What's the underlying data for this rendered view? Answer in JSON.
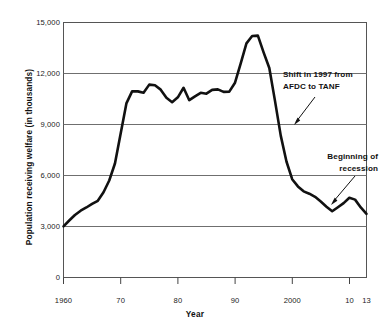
{
  "chart_data": {
    "type": "line",
    "title": "",
    "xlabel": "Year",
    "ylabel": "Population receiving welfare (in thousands)",
    "xlim": [
      1960,
      2013
    ],
    "ylim": [
      0,
      15000
    ],
    "grid": true,
    "legend": "none",
    "ytick_labels": [
      "15,000",
      "12,000",
      "9,000",
      "6,000",
      "3,000",
      "0"
    ],
    "ytick_values": [
      15000,
      12000,
      9000,
      6000,
      3000,
      0
    ],
    "xtick_labels": [
      "1960",
      "70",
      "80",
      "90",
      "2000",
      "10",
      "13"
    ],
    "xtick_values": [
      1960,
      1970,
      1980,
      1990,
      2000,
      2010,
      2013
    ],
    "series": [
      {
        "name": "Population receiving welfare",
        "color": "#111111",
        "x": [
          1960,
          1961,
          1962,
          1963,
          1964,
          1965,
          1966,
          1967,
          1968,
          1969,
          1970,
          1971,
          1972,
          1973,
          1974,
          1975,
          1976,
          1977,
          1978,
          1979,
          1980,
          1981,
          1982,
          1983,
          1984,
          1985,
          1986,
          1987,
          1988,
          1989,
          1990,
          1991,
          1992,
          1993,
          1994,
          1995,
          1996,
          1997,
          1998,
          1999,
          2000,
          2001,
          2002,
          2003,
          2004,
          2005,
          2006,
          2007,
          2008,
          2009,
          2010,
          2011,
          2012,
          2013
        ],
        "values": [
          3005,
          3354,
          3676,
          3930,
          4118,
          4329,
          4513,
          5014,
          5705,
          6706,
          8466,
          10241,
          10947,
          10949,
          10864,
          11346,
          11304,
          11050,
          10570,
          10312,
          10597,
          11160,
          10431,
          10659,
          10866,
          10813,
          11038,
          11065,
          10920,
          10934,
          11460,
          12592,
          13773,
          14205,
          14226,
          13242,
          12321,
          10376,
          8347,
          6824,
          5781,
          5359,
          5069,
          4928,
          4748,
          4471,
          4166,
          3895,
          4134,
          4375,
          4694,
          4580,
          4123,
          3746
        ],
        "annotations": [
          {
            "id": "shift-1997",
            "text_lines": [
              "Shift in 1997 from",
              "AFDC to TANF"
            ],
            "point_year": 1997,
            "point_value": 9100
          },
          {
            "id": "beginning-of-recession",
            "text_lines": [
              "Beginning of",
              "recession"
            ],
            "point_year": 2008,
            "point_value": 4250
          }
        ]
      }
    ]
  }
}
